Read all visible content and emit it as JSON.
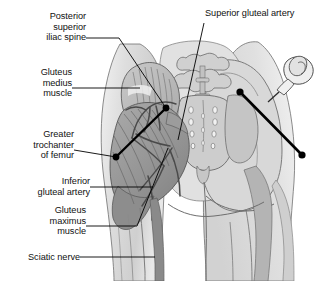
{
  "figure": {
    "type": "anatomical-illustration",
    "view": "posterior",
    "rendering": "grayscale line-and-tone drawing",
    "background_color": "#ffffff",
    "line_color": "#000000",
    "tone_light": "#e3e3e3",
    "tone_mid": "#b9b9b9",
    "tone_dark": "#8d8d8d",
    "tone_darkest": "#6e6e6e"
  },
  "labels": {
    "posterior_superior_iliac_spine": {
      "lines": [
        "Posterior",
        "superior",
        "iliac spine"
      ],
      "line1": "Posterior",
      "line2": "superior",
      "line3": "iliac spine",
      "side": "left"
    },
    "gluteus_medius_muscle": {
      "lines": [
        "Gluteus",
        "medius",
        "muscle"
      ],
      "line1": "Gluteus",
      "line2": "medius",
      "line3": "muscle",
      "side": "left"
    },
    "greater_trochanter_of_femur": {
      "lines": [
        "Greater",
        "trochanter",
        "of femur"
      ],
      "line1": "Greater",
      "line2": "trochanter",
      "line3": "of femur",
      "side": "left"
    },
    "inferior_gluteal_artery": {
      "lines": [
        "Inferior",
        "gluteal artery"
      ],
      "line1": "Inferior",
      "line2": "gluteal artery",
      "side": "left"
    },
    "gluteus_maximus_muscle": {
      "lines": [
        "Gluteus",
        "maximus",
        "muscle"
      ],
      "line1": "Gluteus",
      "line2": "maximus",
      "line3": "muscle",
      "side": "left"
    },
    "sciatic_nerve": {
      "lines": [
        "Sciatic nerve"
      ],
      "line1": "Sciatic nerve",
      "side": "left"
    },
    "superior_gluteal_artery": {
      "lines": [
        "Superior gluteal artery"
      ],
      "line1": "Superior gluteal artery",
      "side": "right"
    }
  },
  "markers": {
    "left_injection_line": {
      "name": "injection guide line (dissected side)",
      "endpoint_upper_right": "posterior superior iliac spine",
      "endpoint_lower_left": "greater trochanter of femur"
    },
    "right_injection_line": {
      "name": "injection guide line (intact side)",
      "endpoint_upper_left": "posterior superior iliac spine",
      "endpoint_lower_right": "greater trochanter of femur"
    },
    "syringe": {
      "name": "syringe with needle",
      "location": "upper right, needle directed at upper outer quadrant"
    }
  }
}
